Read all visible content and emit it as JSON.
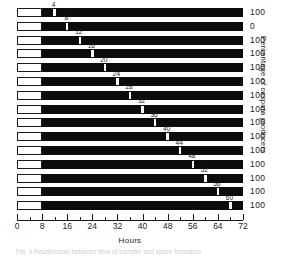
{
  "chart_data": {
    "type": "bar",
    "title": "",
    "subtitle": "",
    "xlabel": "Hours",
    "ylabel": "Percentage of oxspora producers",
    "xlim": [
      0,
      72
    ],
    "xticks": [
      0,
      8,
      16,
      24,
      32,
      40,
      48,
      56,
      64,
      72
    ],
    "xtick_labels": [
      "0",
      "8",
      "16",
      "24",
      "32",
      "40",
      "48",
      "56",
      "64",
      "72"
    ],
    "minor_tick_interval": 4,
    "grid": false,
    "legend": null,
    "orientation": "horizontal",
    "bar_segments": {
      "open_start": 0,
      "open_end": 8,
      "filled_start": 8,
      "filled_end": 72
    },
    "categories": [
      "row-1",
      "row-2",
      "row-3",
      "row-4",
      "row-5",
      "row-6",
      "row-7",
      "row-8",
      "row-9",
      "row-10",
      "row-11",
      "row-12",
      "row-13",
      "row-14",
      "row-15"
    ],
    "rows": [
      {
        "index": 1,
        "marker_label": "4",
        "marker_hours": 12,
        "right_label": "100"
      },
      {
        "index": 2,
        "marker_label": "8",
        "marker_hours": 16,
        "right_label": "0"
      },
      {
        "index": 3,
        "marker_label": "12",
        "marker_hours": 20,
        "right_label": "100"
      },
      {
        "index": 4,
        "marker_label": "16",
        "marker_hours": 24,
        "right_label": "100"
      },
      {
        "index": 5,
        "marker_label": "20",
        "marker_hours": 28,
        "right_label": "100"
      },
      {
        "index": 6,
        "marker_label": "24",
        "marker_hours": 32,
        "right_label": "100"
      },
      {
        "index": 7,
        "marker_label": "28",
        "marker_hours": 36,
        "right_label": "100"
      },
      {
        "index": 8,
        "marker_label": "32",
        "marker_hours": 40,
        "right_label": "100"
      },
      {
        "index": 9,
        "marker_label": "36",
        "marker_hours": 44,
        "right_label": "100"
      },
      {
        "index": 10,
        "marker_label": "40",
        "marker_hours": 48,
        "right_label": "100"
      },
      {
        "index": 11,
        "marker_label": "44",
        "marker_hours": 52,
        "right_label": "100"
      },
      {
        "index": 12,
        "marker_label": "48",
        "marker_hours": 56,
        "right_label": "100"
      },
      {
        "index": 13,
        "marker_label": "52",
        "marker_hours": 60,
        "right_label": "100"
      },
      {
        "index": 14,
        "marker_label": "56",
        "marker_hours": 64,
        "right_label": "100"
      },
      {
        "index": 15,
        "marker_label": "60",
        "marker_hours": 68,
        "right_label": "100"
      }
    ],
    "colors": {
      "filled": "#0c0c0c",
      "open": "#ffffff",
      "outline": "#1a1a1a",
      "marker": "#ffffff",
      "text": "#1a1a1a",
      "background": "#ffffff"
    }
  },
  "caption": {
    "text": "Fig. 4 Relationship between time of transfer and spore formation"
  }
}
